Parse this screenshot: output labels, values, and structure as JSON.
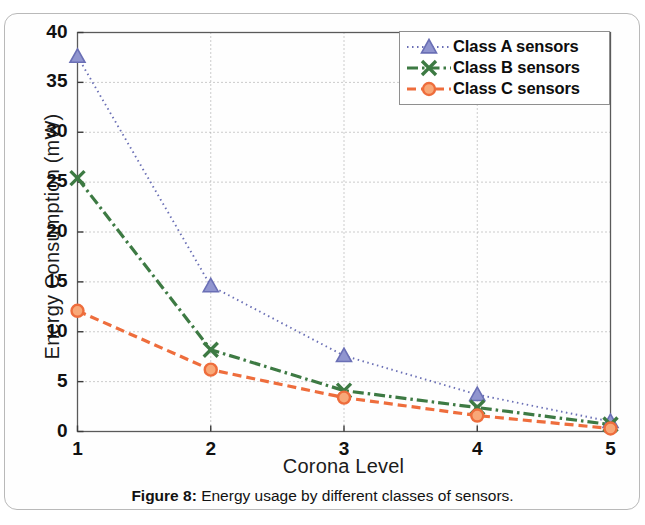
{
  "figure": {
    "caption_label": "Figure 8:",
    "caption_text": " Energy usage by different classes of sensors."
  },
  "chart_data": {
    "type": "line",
    "title": "",
    "xlabel": "Corona Level",
    "ylabel": "Energy Consumption (mW)",
    "x": [
      1,
      2,
      3,
      4,
      5
    ],
    "categories": [
      "1",
      "2",
      "3",
      "4",
      "5"
    ],
    "xlim": [
      1,
      5
    ],
    "ylim": [
      0,
      40
    ],
    "xticks": [
      "1",
      "2",
      "3",
      "4",
      "5"
    ],
    "yticks": [
      "0",
      "5",
      "10",
      "15",
      "20",
      "25",
      "30",
      "35",
      "40"
    ],
    "grid": true,
    "grid_style": "dotted",
    "legend_position": "upper-right-inside",
    "series": [
      {
        "name": "Class A sensors",
        "values": [
          37.6,
          14.6,
          7.6,
          3.7,
          1.0
        ],
        "color": "#6a6fb5",
        "marker": "triangle",
        "linestyle": "dotted"
      },
      {
        "name": "Class B sensors",
        "values": [
          25.4,
          8.2,
          4.1,
          2.4,
          0.7
        ],
        "color": "#3d7a43",
        "marker": "x",
        "linestyle": "dashdot"
      },
      {
        "name": "Class C sensors",
        "values": [
          12.1,
          6.2,
          3.4,
          1.6,
          0.3
        ],
        "color": "#ee6d3c",
        "marker": "circle",
        "linestyle": "dashed"
      }
    ]
  }
}
